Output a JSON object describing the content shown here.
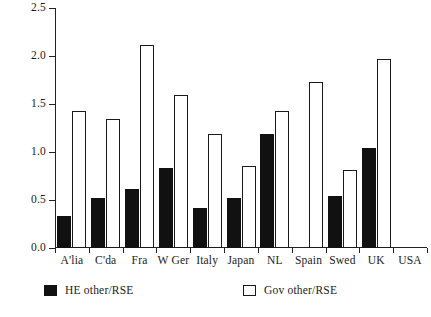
{
  "chart_data": {
    "type": "bar",
    "title": "",
    "subtitle": "",
    "xlabel": "",
    "ylabel": "",
    "categories": [
      "A'lia",
      "C'da",
      "Fra",
      "W Ger",
      "Italy",
      "Japan",
      "NL",
      "Spain",
      "Swed",
      "UK",
      "USA"
    ],
    "series": [
      {
        "name": "HE other/RSE",
        "color": "#111111",
        "values": [
          0.33,
          0.52,
          0.61,
          0.83,
          0.42,
          0.52,
          1.19,
          null,
          0.54,
          1.04,
          null
        ]
      },
      {
        "name": "Gov other/RSE",
        "color": "#ffffff",
        "values": [
          1.43,
          1.34,
          2.11,
          1.59,
          1.19,
          0.85,
          1.43,
          1.73,
          0.81,
          1.97,
          null
        ]
      }
    ],
    "ylim": [
      0.0,
      2.5
    ],
    "ytick_labels": [
      "0.0",
      "0.5",
      "1.0",
      "1.5",
      "2.0",
      "2.5"
    ],
    "ytick_values": [
      0.0,
      0.5,
      1.0,
      1.5,
      2.0,
      2.5
    ],
    "grid": false,
    "legend_position": "bottom"
  },
  "legend": {
    "items": [
      {
        "label": "HE other/RSE",
        "swatch": "filled-black"
      },
      {
        "label": "Gov other/RSE",
        "swatch": "outline-white"
      }
    ]
  },
  "footer": {
    "clipped_text": ""
  }
}
